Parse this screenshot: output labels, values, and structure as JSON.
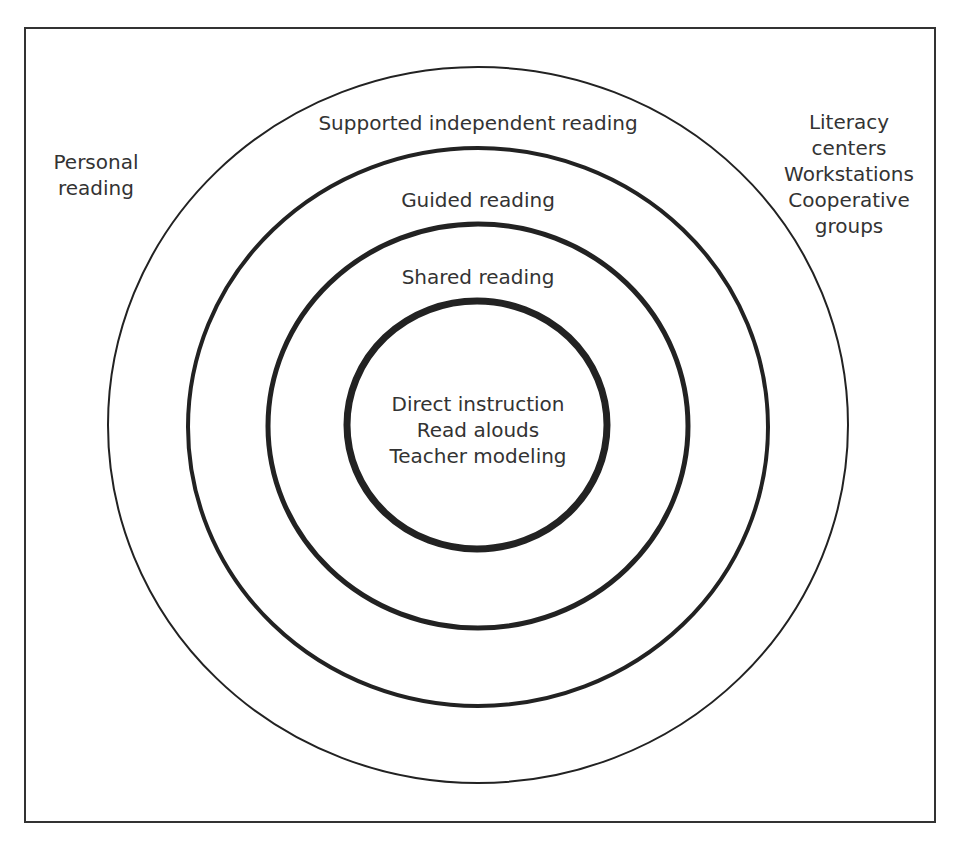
{
  "diagram": {
    "type": "concentric-circles",
    "outside_labels": {
      "left": [
        "Personal",
        "reading"
      ],
      "right": [
        "Literacy",
        "centers",
        "Workstations",
        "Cooperative",
        "groups"
      ]
    },
    "rings": [
      {
        "label": "Supported independent reading"
      },
      {
        "label": "Guided reading"
      },
      {
        "label": "Shared reading"
      }
    ],
    "center": [
      "Direct instruction",
      "Read alouds",
      "Teacher modeling"
    ],
    "colors": {
      "stroke": "#222222",
      "text": "#333333",
      "background": "#ffffff"
    }
  }
}
